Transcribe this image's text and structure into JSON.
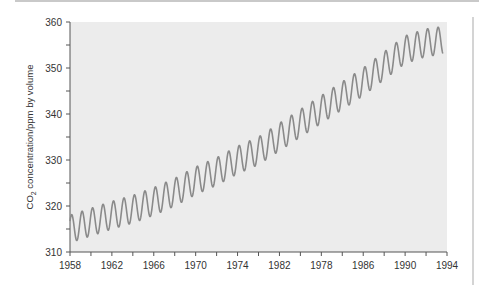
{
  "chart_data": {
    "type": "line",
    "title": "",
    "xlabel": "",
    "ylabel": "CO2 concentration/ppm by volume",
    "ylabel_main": "CO",
    "ylabel_sub": "2",
    "ylabel_rest": " concentration/ppm by volume",
    "xlim": [
      1958,
      1994
    ],
    "ylim": [
      310,
      360
    ],
    "grid": false,
    "legend": null,
    "x_tick_labels": [
      "1958",
      "1962",
      "1966",
      "1970",
      "1974",
      "1982",
      "1978",
      "1986",
      "1990",
      "1994"
    ],
    "y_tick_labels": [
      "310",
      "320",
      "330",
      "340",
      "350",
      "360"
    ],
    "y_ticks": [
      310,
      320,
      330,
      340,
      350,
      360
    ],
    "series": [
      {
        "name": "CO2 concentration (seasonal)",
        "color": "#8a8a8a",
        "trend_x": [
          1958,
          1960,
          1962,
          1964,
          1966,
          1968,
          1970,
          1972,
          1974,
          1976,
          1978,
          1980,
          1982,
          1984,
          1986,
          1988,
          1990,
          1992,
          1993.6
        ],
        "trend_y": [
          315.0,
          316.5,
          318.0,
          319.3,
          321.0,
          323.0,
          325.5,
          327.5,
          330.0,
          332.0,
          335.0,
          338.0,
          341.0,
          344.0,
          347.0,
          350.5,
          354.0,
          355.5,
          356.0
        ],
        "seasonal_amplitude": 3.0
      }
    ],
    "plot_background": "#ececec"
  }
}
